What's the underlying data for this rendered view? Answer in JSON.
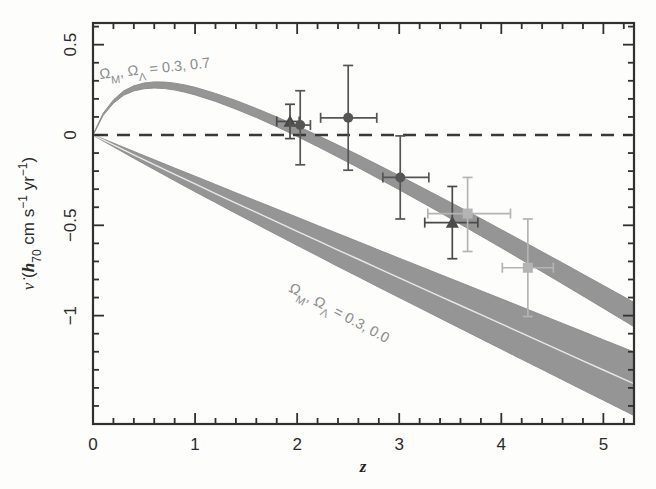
{
  "figure": {
    "background_color": "#fdfdfc",
    "frame_color": "#303030"
  },
  "chart_data": {
    "type": "scatter",
    "title": "",
    "xlabel": "z",
    "ylabel": "v̇ (h₇₀ cm s⁻¹ yr⁻¹)",
    "xlim": [
      0,
      5.3
    ],
    "ylim": [
      -1.6,
      0.62
    ],
    "grid": false,
    "legend_position": "none",
    "xticks": [
      0,
      1,
      2,
      3,
      4,
      5
    ],
    "xtick_labels": [
      "0",
      "1",
      "2",
      "3",
      "4",
      "5"
    ],
    "yticks": [
      0.5,
      0,
      -0.5,
      -1
    ],
    "ytick_labels": [
      "0.5",
      "0",
      "−0.5",
      "−1"
    ],
    "x_minor_tick_step": 0.2,
    "y_minor_tick_step": 0.1,
    "reference_line": {
      "name": "zero-line",
      "y": 0,
      "style": "dashed",
      "color": "#3a3a3a"
    },
    "bands": [
      {
        "name": "lcdm-band",
        "label": "ΩM, ΩΛ = 0.3, 0.7",
        "label_plain": "Omega_M, Omega_Lambda = 0.3, 0.7",
        "color": "#8f8f8f",
        "center": [
          [
            0.0,
            0.0
          ],
          [
            0.1,
            0.115
          ],
          [
            0.2,
            0.185
          ],
          [
            0.3,
            0.232
          ],
          [
            0.4,
            0.258
          ],
          [
            0.5,
            0.272
          ],
          [
            0.6,
            0.277
          ],
          [
            0.7,
            0.275
          ],
          [
            0.8,
            0.268
          ],
          [
            0.9,
            0.257
          ],
          [
            1.0,
            0.243
          ],
          [
            1.2,
            0.208
          ],
          [
            1.4,
            0.167
          ],
          [
            1.6,
            0.122
          ],
          [
            1.8,
            0.073
          ],
          [
            2.0,
            0.021
          ],
          [
            2.2,
            -0.033
          ],
          [
            2.4,
            -0.089
          ],
          [
            2.6,
            -0.146
          ],
          [
            2.8,
            -0.205
          ],
          [
            3.0,
            -0.264
          ],
          [
            3.2,
            -0.325
          ],
          [
            3.4,
            -0.386
          ],
          [
            3.6,
            -0.448
          ],
          [
            3.8,
            -0.511
          ],
          [
            4.0,
            -0.574
          ],
          [
            4.2,
            -0.638
          ],
          [
            4.4,
            -0.702
          ],
          [
            4.6,
            -0.766
          ],
          [
            4.8,
            -0.831
          ],
          [
            5.0,
            -0.896
          ],
          [
            5.3,
            -0.994
          ]
        ],
        "half_width": [
          0.002,
          0.006,
          0.009,
          0.012,
          0.014,
          0.016,
          0.017,
          0.018,
          0.019,
          0.02,
          0.021,
          0.022,
          0.024,
          0.025,
          0.027,
          0.029,
          0.031,
          0.033,
          0.035,
          0.037,
          0.039,
          0.041,
          0.043,
          0.046,
          0.048,
          0.05,
          0.053,
          0.055,
          0.058,
          0.06,
          0.063,
          0.067
        ]
      },
      {
        "name": "open-band",
        "label": "ΩM, ΩΛ = 0.3, 0.0",
        "label_plain": "Omega_M, Omega_Lambda = 0.3, 0.0",
        "color": "#8f8f8f",
        "center": [
          [
            0.0,
            0.0
          ],
          [
            0.2,
            -0.055
          ],
          [
            0.4,
            -0.11
          ],
          [
            0.6,
            -0.164
          ],
          [
            0.8,
            -0.218
          ],
          [
            1.0,
            -0.271
          ],
          [
            1.2,
            -0.324
          ],
          [
            1.4,
            -0.377
          ],
          [
            1.6,
            -0.429
          ],
          [
            1.8,
            -0.481
          ],
          [
            2.0,
            -0.533
          ],
          [
            2.2,
            -0.585
          ],
          [
            2.4,
            -0.637
          ],
          [
            2.6,
            -0.688
          ],
          [
            2.8,
            -0.74
          ],
          [
            3.0,
            -0.791
          ],
          [
            3.2,
            -0.842
          ],
          [
            3.4,
            -0.893
          ],
          [
            3.6,
            -0.944
          ],
          [
            3.8,
            -0.995
          ],
          [
            4.0,
            -1.046
          ],
          [
            4.2,
            -1.097
          ],
          [
            4.4,
            -1.148
          ],
          [
            4.6,
            -1.199
          ],
          [
            4.8,
            -1.25
          ],
          [
            5.0,
            -1.301
          ],
          [
            5.3,
            -1.377
          ]
        ],
        "half_width": [
          0.002,
          0.01,
          0.019,
          0.027,
          0.035,
          0.043,
          0.05,
          0.057,
          0.064,
          0.071,
          0.078,
          0.084,
          0.091,
          0.097,
          0.103,
          0.109,
          0.115,
          0.121,
          0.127,
          0.133,
          0.139,
          0.145,
          0.15,
          0.156,
          0.162,
          0.167,
          0.176
        ]
      }
    ],
    "series": [
      {
        "name": "triangles",
        "marker": "triangle",
        "color": "#4a4a4a",
        "points": [
          {
            "x": 1.93,
            "y": 0.075,
            "xerr_lo": 0.13,
            "xerr_hi": 0.09,
            "yerr_lo": 0.095,
            "yerr_hi": 0.095
          },
          {
            "x": 3.52,
            "y": -0.485,
            "xerr_lo": 0.27,
            "xerr_hi": 0.25,
            "yerr_lo": 0.2,
            "yerr_hi": 0.2
          }
        ]
      },
      {
        "name": "circles",
        "marker": "circle",
        "color": "#555555",
        "points": [
          {
            "x": 2.03,
            "y": 0.055,
            "xerr_lo": 0.1,
            "xerr_hi": 0.1,
            "yerr_lo": 0.22,
            "yerr_hi": 0.19
          },
          {
            "x": 2.5,
            "y": 0.095,
            "xerr_lo": 0.27,
            "xerr_hi": 0.28,
            "yerr_lo": 0.29,
            "yerr_hi": 0.29
          },
          {
            "x": 3.01,
            "y": -0.235,
            "xerr_lo": 0.17,
            "xerr_hi": 0.28,
            "yerr_lo": 0.23,
            "yerr_hi": 0.23
          }
        ]
      },
      {
        "name": "squares",
        "marker": "square",
        "color": "#b4b4b4",
        "points": [
          {
            "x": 3.67,
            "y": -0.435,
            "xerr_lo": 0.39,
            "xerr_hi": 0.42,
            "yerr_lo": 0.21,
            "yerr_hi": 0.2
          },
          {
            "x": 4.26,
            "y": -0.735,
            "xerr_lo": 0.25,
            "xerr_hi": 0.25,
            "yerr_lo": 0.27,
            "yerr_hi": 0.27
          }
        ]
      }
    ]
  }
}
